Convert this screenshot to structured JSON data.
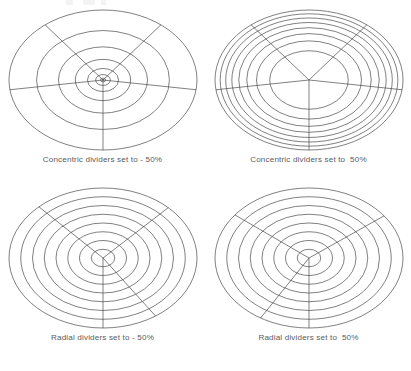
{
  "page": {
    "background_color": "#ffffff",
    "stroke_color": "#4a4a4a",
    "caption_color": "#5a5b5f"
  },
  "panels": [
    {
      "id": "concentric-negative",
      "caption": "Concentric dividers set to - 50%",
      "position": "top-left",
      "grid": {
        "type": "polar-ellipse",
        "ring_count": 8,
        "ring_distribution": "compressed-toward-center",
        "ring_exponent": 2.6,
        "spoke_count": 5,
        "spoke_distribution": "even",
        "spoke_angles_deg": [
          128,
          52,
          -8,
          -90,
          -172
        ],
        "center_x": 103,
        "center_y": 76,
        "radius_x": 94,
        "radius_y": 70
      }
    },
    {
      "id": "concentric-positive",
      "caption": "Concentric dividers set to  50%",
      "position": "top-right",
      "grid": {
        "type": "polar-ellipse",
        "ring_count": 8,
        "ring_distribution": "compressed-toward-edge",
        "ring_exponent": 0.42,
        "spoke_count": 5,
        "spoke_distribution": "even",
        "spoke_angles_deg": [
          128,
          52,
          -8,
          -90,
          -172
        ],
        "center_x": 103,
        "center_y": 76,
        "radius_x": 94,
        "radius_y": 70
      }
    },
    {
      "id": "radial-negative",
      "caption": "Radial dividers set to - 50%",
      "position": "bottom-left",
      "grid": {
        "type": "polar-ellipse",
        "ring_count": 8,
        "ring_distribution": "even",
        "ring_exponent": 1,
        "spoke_count": 4,
        "spoke_distribution": "bunched-upper-left",
        "spoke_angles_deg": [
          133,
          46,
          -56,
          -90
        ],
        "center_x": 103,
        "center_y": 76,
        "radius_x": 94,
        "radius_y": 70
      }
    },
    {
      "id": "radial-positive",
      "caption": "Radial dividers set to  50%",
      "position": "bottom-right",
      "grid": {
        "type": "polar-ellipse",
        "ring_count": 8,
        "ring_distribution": "even",
        "ring_exponent": 1,
        "spoke_count": 4,
        "spoke_distribution": "bunched-upper-right",
        "spoke_angles_deg": [
          142,
          37,
          -121,
          -90
        ],
        "center_x": 103,
        "center_y": 76,
        "radius_x": 94,
        "radius_y": 70
      }
    }
  ]
}
